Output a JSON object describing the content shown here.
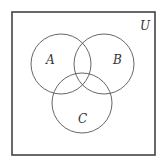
{
  "diagram": {
    "type": "venn",
    "universe": {
      "label": "U",
      "x": 12,
      "y": 12,
      "width": 143,
      "height": 143
    },
    "sets": [
      {
        "label": "A",
        "cx": 61,
        "cy": 64,
        "r": 30,
        "label_x": 49,
        "label_y": 64
      },
      {
        "label": "B",
        "cx": 104,
        "cy": 64,
        "r": 30,
        "label_x": 116,
        "label_y": 64
      },
      {
        "label": "C",
        "cx": 82,
        "cy": 103,
        "r": 30,
        "label_x": 82,
        "label_y": 123
      }
    ]
  }
}
